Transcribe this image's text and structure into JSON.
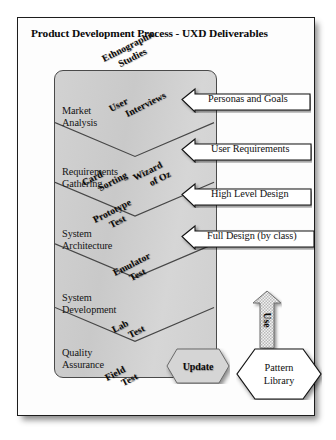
{
  "figure": {
    "title": "Product Development Process - UXD Deliverables",
    "frame_border_color": "#1d1d1d",
    "band_fill_color": "#cfcfcf"
  },
  "process_band": {
    "stages": [
      {
        "id": "market-analysis",
        "label": "Market\nAnalysis"
      },
      {
        "id": "requirements-gathering",
        "label": "Requirements\nGathering"
      },
      {
        "id": "system-architecture",
        "label": "System\nArchitecture"
      },
      {
        "id": "system-development",
        "label": "System\nDevelopment"
      },
      {
        "id": "quality-assurance",
        "label": "Quality\nAssurance"
      }
    ],
    "stage_labels": {
      "market_analysis_1": "Market",
      "market_analysis_2": "Analysis",
      "requirements_1": "Requirements",
      "requirements_2": "Gathering",
      "architecture_1": "System",
      "architecture_2": "Architecture",
      "development_1": "System",
      "development_2": "Development",
      "quality_1": "Quality",
      "quality_2": "Assurance"
    }
  },
  "deliverables": [
    {
      "id": "ethnographic-studies",
      "line1": "Ethnographic",
      "line2": "Studies"
    },
    {
      "id": "user-interviews",
      "line1": "User",
      "line2": "Interviews"
    },
    {
      "id": "card-sorting",
      "line1": "Card",
      "line2": "Sorting"
    },
    {
      "id": "wizard-of-oz",
      "line1": "Wizard",
      "line2": "of Oz"
    },
    {
      "id": "prototype-test",
      "line1": "Prototype",
      "line2": "Test"
    },
    {
      "id": "emulator-test",
      "line1": "Emulator",
      "line2": "Test"
    },
    {
      "id": "lab-test",
      "line1": "Lab",
      "line2": "Test"
    },
    {
      "id": "field-test",
      "line1": "Field",
      "line2": "Test"
    }
  ],
  "deliverable_text": {
    "ethnographic_1": "Ethnographic",
    "ethnographic_2": "Studies",
    "interviews_1": "User",
    "interviews_2": "Interviews",
    "cardsort_1": "Card",
    "cardsort_2": "Sorting",
    "wizard_1": "Wizard",
    "wizard_2": "of Oz",
    "prototype_1": "Prototype",
    "prototype_2": "Test",
    "emulator_1": "Emulator",
    "emulator_2": "Test",
    "lab_1": "Lab",
    "lab_2": "Test",
    "field_1": "Field",
    "field_2": "Test"
  },
  "callouts": [
    {
      "id": "personas-and-goals",
      "label": "Personas and Goals"
    },
    {
      "id": "user-requirements",
      "label": "User Requirements"
    },
    {
      "id": "high-level-design",
      "label": "High Level Design"
    },
    {
      "id": "full-design",
      "label": "Full Design (by class)"
    }
  ],
  "callout_text": {
    "personas": "Personas and Goals",
    "requirements": "User Requirements",
    "highlevel": "High Level Design",
    "fulldesign": "Full Design (by class)"
  },
  "artifacts": {
    "update_label": "Update",
    "use_label": "Use",
    "pattern_library_line1": "Pattern",
    "pattern_library_line2": "Library"
  }
}
